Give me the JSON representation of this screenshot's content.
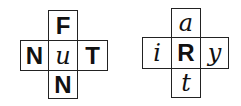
{
  "puzzles": [
    {
      "center": {
        "text": "u",
        "style": "script"
      },
      "top": {
        "text": "F",
        "style": "print"
      },
      "left": {
        "text": "N",
        "style": "print"
      },
      "right": {
        "text": "T",
        "style": "print"
      },
      "bottom": {
        "text": "N",
        "style": "print"
      }
    },
    {
      "center": {
        "text": "R",
        "style": "print"
      },
      "top": {
        "text": "a",
        "style": "script"
      },
      "left": {
        "text": "i",
        "style": "script"
      },
      "right": {
        "text": "y",
        "style": "script"
      },
      "bottom": {
        "text": "t",
        "style": "script"
      }
    }
  ]
}
